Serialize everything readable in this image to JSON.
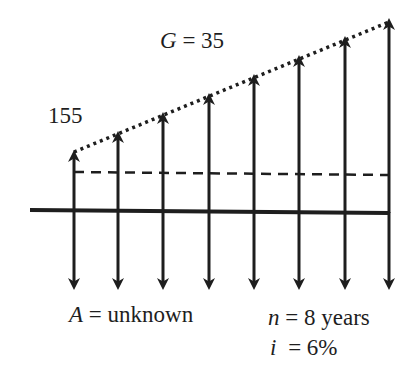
{
  "diagram": {
    "type": "cash-flow-diagram",
    "gradient_label": {
      "var": "G",
      "eq": " = 35"
    },
    "base_value_label": "155",
    "annuity_label": {
      "var": "A",
      "eq": " = unknown"
    },
    "period_label": {
      "var": "n",
      "eq": " = 8 years"
    },
    "rate_label": {
      "var": "i",
      "eq": " = 6%"
    },
    "colors": {
      "ink": "#1e1e1e",
      "background": "#ffffff"
    },
    "periods": 8,
    "gradient": 35,
    "base_amount": 155,
    "interest_rate_percent": 6,
    "up_arrows_values": [
      155,
      190,
      225,
      260,
      295,
      330,
      365,
      400
    ],
    "down_arrows": "equal unknown annuity A each period"
  }
}
